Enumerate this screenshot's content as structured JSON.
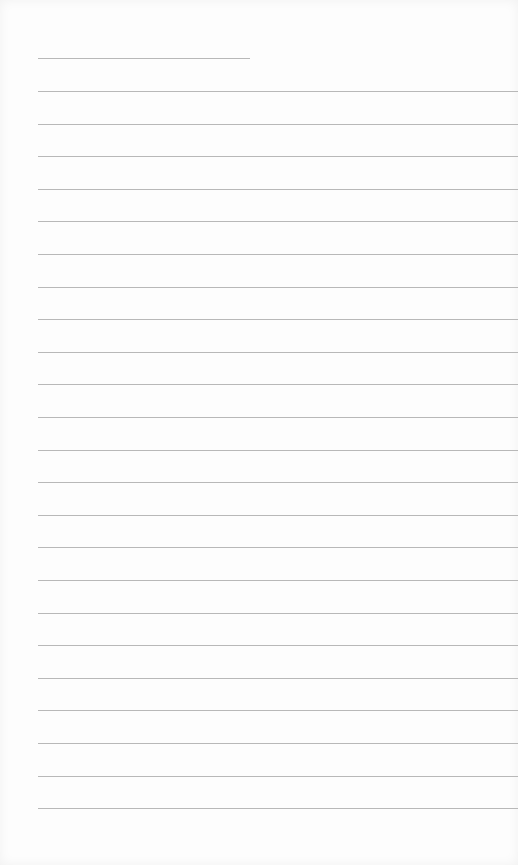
{
  "paper": {
    "type": "blank lined notebook page",
    "line_color": "#b8b8b8",
    "background": "#fdfdfd",
    "title_line": {
      "present": true
    },
    "ruled_line_count": 23,
    "ruled_line_spacing_px": 32.6,
    "first_ruled_line_y": 91
  }
}
